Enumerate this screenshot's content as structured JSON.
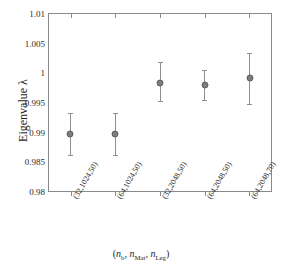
{
  "chart_data": {
    "type": "scatter",
    "title": "",
    "xlabel": "(n_b, n_Mat, n_Leg)",
    "ylabel": "Eigenvalue λ",
    "categories": [
      "(32,1024,50)",
      "(64,1024,50)",
      "(32,2048,50)",
      "(64,2048,50)",
      "(64,2048,70)"
    ],
    "values": [
      0.9897,
      0.9897,
      0.9983,
      0.998,
      0.9991
    ],
    "yerr_lower": [
      0.0035,
      0.0035,
      0.003,
      0.0025,
      0.0043
    ],
    "yerr_upper": [
      0.0035,
      0.0035,
      0.0035,
      0.0025,
      0.0042
    ],
    "ylim": [
      0.98,
      1.01
    ],
    "yticks": [
      0.98,
      0.985,
      0.99,
      0.995,
      1,
      1.005,
      1.01
    ],
    "ytick_labels": [
      "0.98",
      "0.985",
      "0.99",
      "0.995",
      "1",
      "1.005",
      "1.01"
    ],
    "xlim": [
      0.5,
      5.5
    ],
    "grid": false,
    "legend": null,
    "marker": "filled-circle",
    "marker_color": "#7d7d7d",
    "errorbar_color": "#8f8f8f",
    "axis_color": "#8a8a8a"
  },
  "axes": {
    "y_title_text": "Eigenvalue λ",
    "x_title_prefix": "(",
    "x_title_n1": "n",
    "x_title_n1_sub": "b",
    "x_title_sep1": ", ",
    "x_title_n2": "n",
    "x_title_n2_sub": "Mat",
    "x_title_sep2": ", ",
    "x_title_n3": "n",
    "x_title_n3_sub": "Leg",
    "x_title_suffix": ")"
  }
}
